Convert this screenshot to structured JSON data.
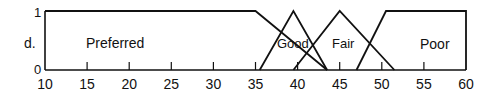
{
  "chart_data": {
    "type": "line",
    "title": "",
    "xlabel": "",
    "ylabel": "d.",
    "xlim": [
      10,
      60
    ],
    "ylim": [
      0,
      1
    ],
    "x_ticks": [
      10,
      15,
      20,
      25,
      30,
      35,
      40,
      45,
      50,
      55,
      60
    ],
    "y_ticks": [
      0,
      1
    ],
    "grid": false,
    "legend": "inline labels",
    "series": [
      {
        "name": "Preferred",
        "x": [
          10,
          35,
          43.5
        ],
        "y": [
          1,
          1,
          0
        ],
        "label_pos": [
          17,
          0.5
        ]
      },
      {
        "name": "Good",
        "x": [
          35.5,
          39.5,
          43.5
        ],
        "y": [
          0,
          1,
          0
        ],
        "label_pos": [
          39.5,
          0.5
        ]
      },
      {
        "name": "Fair",
        "x": [
          39.5,
          45,
          51.5
        ],
        "y": [
          0,
          1,
          0
        ],
        "label_pos": [
          45.2,
          0.5
        ]
      },
      {
        "name": "Poor",
        "x": [
          47,
          50.5,
          60,
          60
        ],
        "y": [
          0,
          1,
          1,
          0
        ],
        "label_pos": [
          55.3,
          0.5
        ]
      }
    ]
  },
  "axis": {
    "y_label": "d.",
    "y_top": "1",
    "y_bottom": "0",
    "x_tick_labels": [
      "10",
      "15",
      "20",
      "25",
      "30",
      "35",
      "40",
      "45",
      "50",
      "55",
      "60"
    ]
  },
  "labels": {
    "preferred": "Preferred",
    "good": "Good",
    "fair": "Fair",
    "poor": "Poor"
  }
}
